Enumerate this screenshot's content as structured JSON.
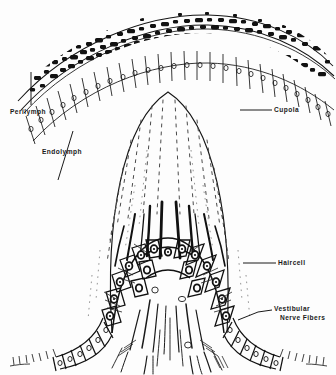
{
  "figure": {
    "name": "crista-ampullaris-cupola",
    "background_color": "#fdfdfd",
    "ink_color": "#111111",
    "width": 336,
    "height": 375
  },
  "labels": {
    "perilymph": "Perilymph",
    "endolymph": "Endolymph",
    "cupola": "Cupola",
    "haircell": "Haircell",
    "vestibular_nerve_fibers_line1": "Vestibular",
    "vestibular_nerve_fibers_line2": "Nerve Fibers"
  },
  "structures": [
    {
      "name": "stippled-bone-band",
      "description": "dark mottled stipple arch across the top of the figure"
    },
    {
      "name": "epithelial-cell-row-arch",
      "description": "row of columnar epithelial cells with round nuclei following the arch"
    },
    {
      "name": "cupola-dome",
      "description": "large pale dome-shaped gelatinous cupola in the centre"
    },
    {
      "name": "stereocilia-dashes",
      "description": "vertical dashed channels inside the cupola converging downward"
    },
    {
      "name": "haircell-cluster",
      "description": "cluster of hair cells with dark nuclei beneath the cupola"
    },
    {
      "name": "left-foot-epithelium",
      "description": "flared row of supporting cells at the lower left base"
    },
    {
      "name": "right-foot-epithelium",
      "description": "flared row of supporting cells at the lower right base"
    },
    {
      "name": "nerve-fiber-strands",
      "description": "fine nerve fibre strands running down the central stalk"
    }
  ],
  "leader_lines": [
    {
      "name": "leader-perilymph",
      "from": [
        31,
        72
      ],
      "to": [
        31,
        105
      ]
    },
    {
      "name": "leader-endolymph",
      "from": [
        72,
        133
      ],
      "to": [
        60,
        178
      ]
    },
    {
      "name": "leader-cupola",
      "from": [
        240,
        110
      ],
      "to": [
        272,
        110
      ]
    },
    {
      "name": "leader-haircell",
      "from": [
        243,
        263
      ],
      "to": [
        276,
        263
      ]
    },
    {
      "name": "leader-vnf",
      "from": [
        240,
        318
      ],
      "to": [
        272,
        309
      ]
    }
  ]
}
